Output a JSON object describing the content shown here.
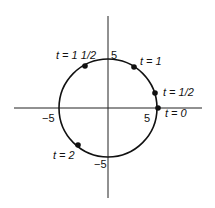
{
  "diagram": {
    "type": "parametric-circle",
    "axes": {
      "x_ticks": [
        {
          "label": "-5"
        },
        {
          "label": "5"
        }
      ],
      "y_ticks": [
        {
          "label": "5"
        },
        {
          "label": "-5"
        }
      ]
    },
    "circle": {
      "radius": 5,
      "center": [
        0,
        0
      ]
    },
    "points": [
      {
        "t_label": "t = 0"
      },
      {
        "t_label": "t = 1/2"
      },
      {
        "t_label": "t = 1"
      },
      {
        "t_label": "t = 1 1/2"
      },
      {
        "t_label": "t = 2"
      }
    ],
    "colors": {
      "stroke": "#111111",
      "background": "#ffffff"
    }
  }
}
